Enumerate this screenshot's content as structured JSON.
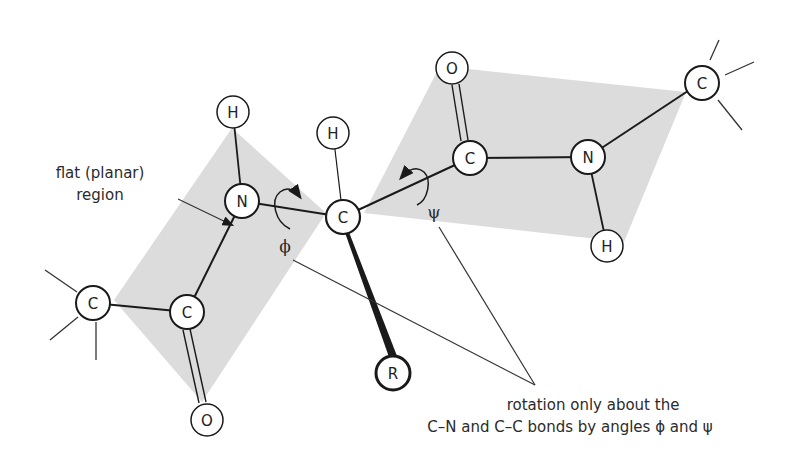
{
  "diagram": {
    "colors": {
      "plane_fill": "#dcdcdc",
      "bond": "#1a1a1a",
      "atom_fill": "#ffffff",
      "atom_stroke": "#1a1a1a",
      "text": "#2b2b2b"
    },
    "atoms": {
      "c_left_methyl": "C",
      "c_left_carbonyl": "C",
      "o_left": "O",
      "n_left": "N",
      "h_left": "H",
      "c_alpha": "C",
      "h_alpha": "H",
      "r_sidechain": "R",
      "c_right_carbonyl": "C",
      "o_right": "O",
      "n_right": "N",
      "h_right": "H",
      "c_right_alpha": "C"
    },
    "angles": {
      "phi": "ϕ",
      "psi": "ψ"
    },
    "labels": {
      "planar_line1": "flat (planar)",
      "planar_line2": "region",
      "rotation_line1": "rotation only about the",
      "rotation_line2": "C–N and C–C bonds by angles ϕ and ψ"
    }
  }
}
